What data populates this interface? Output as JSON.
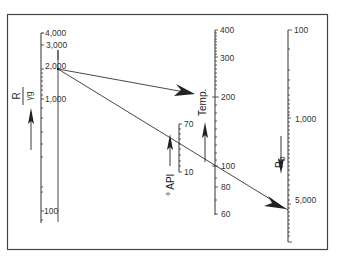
{
  "diagram": {
    "type": "nomograph",
    "colors": {
      "line": "#333333",
      "frame": "#444444",
      "background": "#ffffff"
    },
    "scales": [
      {
        "id": "r-over-gamma",
        "title_numerator": "R",
        "title_denominator": "γg",
        "direction": "up",
        "tick_labels": [
          "4,000",
          "3,000",
          "2,000",
          "1,000",
          "100"
        ]
      },
      {
        "id": "api",
        "title": "° API",
        "direction": "up",
        "tick_labels": [
          "70",
          "10"
        ]
      },
      {
        "id": "temp",
        "title": "Temp.",
        "direction": "up",
        "tick_labels": [
          "400",
          "300",
          "200",
          "100",
          "80",
          "60"
        ]
      },
      {
        "id": "pb",
        "title": "Pb",
        "title_main": "P",
        "title_sub": "b",
        "direction": "down",
        "tick_labels": [
          "100",
          "1,000",
          "5,000"
        ]
      }
    ]
  }
}
